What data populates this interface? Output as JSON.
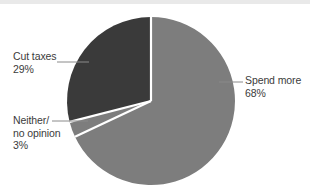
{
  "chart_data": {
    "type": "pie",
    "title": "",
    "subtitle": "",
    "xlabel": "",
    "ylabel": "",
    "legend_position": "none",
    "grid": false,
    "categories": [
      "Spend more",
      "Neither/no opinion",
      "Cut taxes"
    ],
    "values": [
      68,
      3,
      29
    ],
    "unit": "%",
    "start_angle_deg": 0,
    "direction": "clockwise",
    "slices": [
      {
        "name": "Spend more",
        "value": 68,
        "value_label": "68%",
        "color": "#7d7d7d",
        "start_deg": 0,
        "end_deg": 244.8
      },
      {
        "name": "Neither/no opinion",
        "value": 3,
        "value_label": "3%",
        "color": "#7d7d7d",
        "start_deg": 244.8,
        "end_deg": 255.6
      },
      {
        "name": "Cut taxes",
        "value": 29,
        "value_label": "29%",
        "color": "#3a3a3a",
        "start_deg": 255.6,
        "end_deg": 360
      }
    ],
    "annotations": [
      {
        "name": "cut-taxes",
        "lines": [
          "Cut taxes",
          "29%"
        ],
        "leader_line": true
      },
      {
        "name": "neither-no-opinion",
        "lines": [
          "Neither/",
          "no opinion",
          "3%"
        ],
        "leader_line": true
      },
      {
        "name": "spend-more",
        "lines": [
          "Spend more",
          "68%"
        ],
        "leader_line": true
      }
    ]
  },
  "labels": {
    "cut_taxes": {
      "line1": "Cut taxes",
      "line2": "29%"
    },
    "neither": {
      "line1": "Neither/",
      "line2": "no opinion",
      "line3": "3%"
    },
    "spend_more": {
      "line1": "Spend more",
      "line2": "68%"
    }
  },
  "colors": {
    "slice_light": "#7d7d7d",
    "slice_dark": "#3a3a3a",
    "separator": "#ffffff",
    "text": "#3b3b3b",
    "leader_line": "#8a8a8a",
    "background": "#ffffff",
    "top_strip": "#e9e9e9"
  }
}
